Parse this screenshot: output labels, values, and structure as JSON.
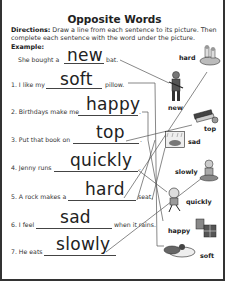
{
  "worksheet": {
    "title": "Opposite Words",
    "directions_label": "Directions:",
    "directions_text": " Draw a line from each sentence to its picture. Then complete each sentence with the word under the picture.",
    "example_label": "Example:"
  },
  "sentences": [
    {
      "before": "She bought a",
      "answer": "new",
      "after": "bat."
    },
    {
      "before": "1. I like my",
      "answer": "soft",
      "after": "pillow."
    },
    {
      "before": "2. Birthdays make me",
      "answer": "happy",
      "after": "."
    },
    {
      "before": "3. Put that book on",
      "answer": "top",
      "after": "."
    },
    {
      "before": "4. Jenny runs",
      "answer": "quickly",
      "after": "."
    },
    {
      "before": "5. A rock makes a",
      "answer": "hard",
      "after": "seat."
    },
    {
      "before": "6. I feel",
      "answer": "sad",
      "after": "when it rains."
    },
    {
      "before": "7. He eats",
      "answer": "slowly",
      "after": "."
    }
  ],
  "pictures": [
    {
      "label": "hard",
      "icon": "rock-seat-icon"
    },
    {
      "label": "new",
      "icon": "baseball-player-icon"
    },
    {
      "label": "top",
      "icon": "book-stack-icon"
    },
    {
      "label": "sad",
      "icon": "rain-sad-icon"
    },
    {
      "label": "slowly",
      "icon": "eating-slowly-icon"
    },
    {
      "label": "quickly",
      "icon": "running-girl-icon"
    },
    {
      "label": "happy",
      "icon": "birthday-presents-icon"
    },
    {
      "label": "soft",
      "icon": "pillow-icon"
    }
  ]
}
